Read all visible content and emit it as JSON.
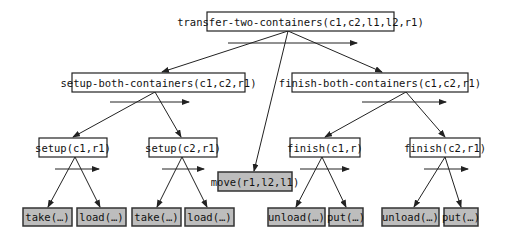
{
  "diagram": {
    "type": "hierarchical task network decomposition tree",
    "colors": {
      "compound_fill": "#ffffff",
      "primitive_fill": "#bdbdbd",
      "stroke": "#222222"
    },
    "nodes": {
      "root": {
        "label": "transfer-two-containers(c1,c2,l1,l2,r1)",
        "kind": "compound"
      },
      "setup_both": {
        "label": "setup-both-containers(c1,c2,r1)",
        "kind": "compound"
      },
      "finish_both": {
        "label": "finish-both-containers(c1,c2,r1)",
        "kind": "compound"
      },
      "move": {
        "label": "move(r1,l2,l1)",
        "kind": "primitive"
      },
      "setup1": {
        "label": "setup(c1,r1)",
        "kind": "compound"
      },
      "setup2": {
        "label": "setup(c2,r1)",
        "kind": "compound"
      },
      "finish1": {
        "label": "finish(c1,r)",
        "kind": "compound"
      },
      "finish2": {
        "label": "finish(c2,r1)",
        "kind": "compound"
      },
      "take1": {
        "label": "take(…)",
        "kind": "primitive"
      },
      "load1": {
        "label": "load(…)",
        "kind": "primitive"
      },
      "take2": {
        "label": "take(…)",
        "kind": "primitive"
      },
      "load2": {
        "label": "load(…)",
        "kind": "primitive"
      },
      "unload1": {
        "label": "unload(…)",
        "kind": "primitive"
      },
      "put1": {
        "label": "put(…)",
        "kind": "primitive"
      },
      "unload2": {
        "label": "unload(…)",
        "kind": "primitive"
      },
      "put2": {
        "label": "put(…)",
        "kind": "primitive"
      }
    },
    "edges": [
      [
        "root",
        "setup_both"
      ],
      [
        "root",
        "move"
      ],
      [
        "root",
        "finish_both"
      ],
      [
        "setup_both",
        "setup1"
      ],
      [
        "setup_both",
        "setup2"
      ],
      [
        "finish_both",
        "finish1"
      ],
      [
        "finish_both",
        "finish2"
      ],
      [
        "setup1",
        "take1"
      ],
      [
        "setup1",
        "load1"
      ],
      [
        "setup2",
        "take2"
      ],
      [
        "setup2",
        "load2"
      ],
      [
        "finish1",
        "unload1"
      ],
      [
        "finish1",
        "put1"
      ],
      [
        "finish2",
        "unload2"
      ],
      [
        "finish2",
        "put2"
      ]
    ]
  }
}
